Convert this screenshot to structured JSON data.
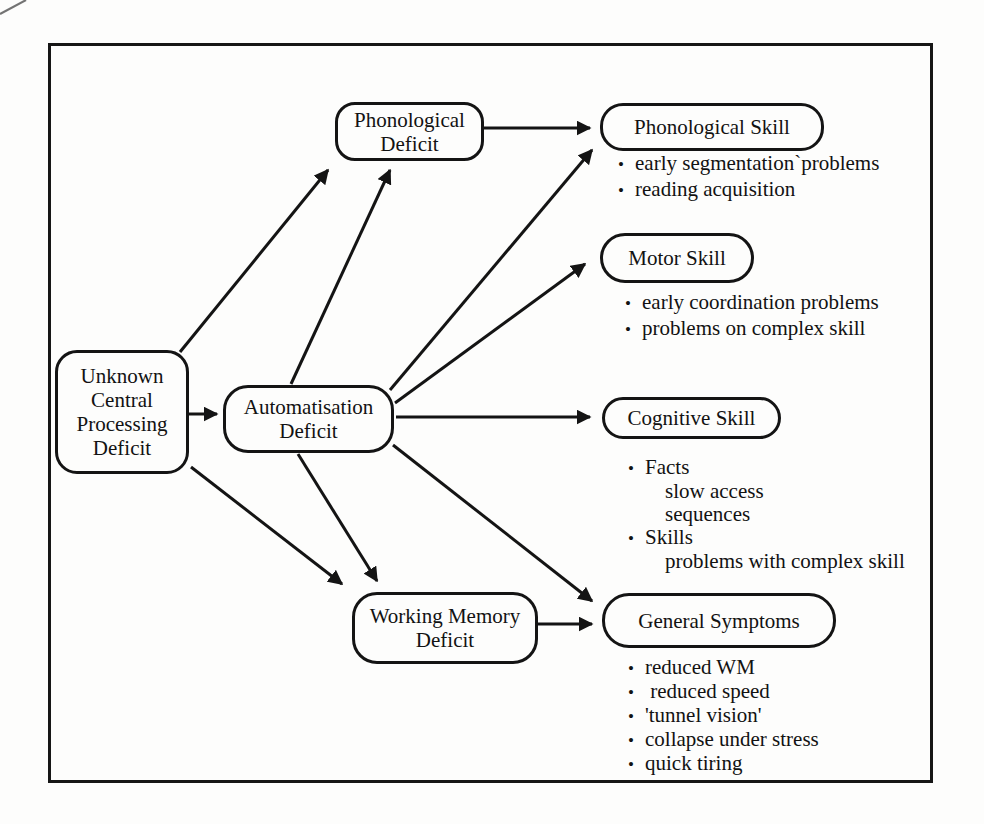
{
  "bullet_char": "•",
  "colors": {
    "ink": "#141414",
    "paper": "#fdfdfc"
  },
  "nodes": {
    "unknown_central_processing_deficit": {
      "lines": [
        "Unknown",
        "Central",
        "Processing",
        "Deficit"
      ]
    },
    "phonological_deficit": {
      "lines": [
        "Phonological",
        "Deficit"
      ]
    },
    "automatisation_deficit": {
      "lines": [
        "Automatisation",
        "Deficit"
      ]
    },
    "working_memory_deficit": {
      "lines": [
        "Working Memory",
        "Deficit"
      ]
    },
    "phonological_skill": {
      "label": "Phonological Skill"
    },
    "motor_skill": {
      "label": "Motor Skill"
    },
    "cognitive_skill": {
      "label": "Cognitive Skill"
    },
    "general_symptoms": {
      "label": "General Symptoms"
    }
  },
  "lists": {
    "phonological_skill": {
      "items": [
        {
          "bullet": true,
          "text": "early segmentation`problems"
        },
        {
          "bullet": true,
          "text": "reading acquisition"
        }
      ]
    },
    "motor_skill": {
      "items": [
        {
          "bullet": true,
          "text": "early coordination problems"
        },
        {
          "bullet": true,
          "text": "problems on complex skill"
        }
      ]
    },
    "cognitive_skill": {
      "items": [
        {
          "bullet": true,
          "text": "Facts"
        },
        {
          "bullet": false,
          "text": "slow access"
        },
        {
          "bullet": false,
          "text": "sequences"
        },
        {
          "bullet": true,
          "text": "Skills"
        },
        {
          "bullet": false,
          "text": "problems with complex skill"
        }
      ]
    },
    "general_symptoms": {
      "items": [
        {
          "bullet": true,
          "text": "reduced WM"
        },
        {
          "bullet": true,
          "text": " reduced speed"
        },
        {
          "bullet": true,
          "text": "'tunnel vision'"
        },
        {
          "bullet": true,
          "text": "collapse under stress"
        },
        {
          "bullet": true,
          "text": "quick tiring"
        }
      ]
    }
  },
  "edges": [
    {
      "from": "unknown_central_processing_deficit",
      "to": "automatisation_deficit"
    },
    {
      "from": "unknown_central_processing_deficit",
      "to": "phonological_deficit"
    },
    {
      "from": "unknown_central_processing_deficit",
      "to": "working_memory_deficit"
    },
    {
      "from": "automatisation_deficit",
      "to": "phonological_deficit"
    },
    {
      "from": "automatisation_deficit",
      "to": "phonological_skill"
    },
    {
      "from": "automatisation_deficit",
      "to": "motor_skill"
    },
    {
      "from": "automatisation_deficit",
      "to": "cognitive_skill"
    },
    {
      "from": "automatisation_deficit",
      "to": "general_symptoms"
    },
    {
      "from": "automatisation_deficit",
      "to": "working_memory_deficit"
    },
    {
      "from": "phonological_deficit",
      "to": "phonological_skill"
    },
    {
      "from": "working_memory_deficit",
      "to": "general_symptoms"
    }
  ]
}
